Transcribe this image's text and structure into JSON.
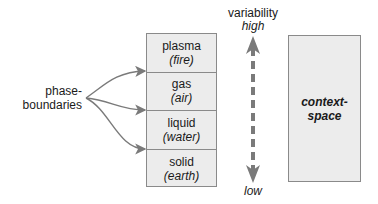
{
  "boundaries": {
    "label_line1": "phase-",
    "label_line2": "boundaries"
  },
  "phases": [
    {
      "name": "plasma",
      "alt": "(fire)"
    },
    {
      "name": "gas",
      "alt": "(air)"
    },
    {
      "name": "liquid",
      "alt": "(water)"
    },
    {
      "name": "solid",
      "alt": "(earth)"
    }
  ],
  "variability": {
    "title": "variability",
    "high": "high",
    "low": "low"
  },
  "context": {
    "line1": "context-",
    "line2": "space"
  },
  "colors": {
    "box_fill": "#ececec",
    "box_border": "#8a8a8a",
    "arrow": "#7a7a7a"
  }
}
